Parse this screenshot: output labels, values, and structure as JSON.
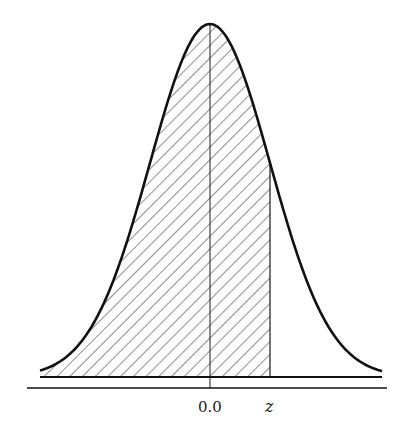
{
  "chart_data": {
    "type": "area",
    "title": "",
    "distribution": "standard normal",
    "mean": 0.0,
    "sd": 1.0,
    "x_range": [
      -2.85,
      2.87
    ],
    "shaded_region": {
      "from": "-inf",
      "to": "z",
      "pattern": "diagonal-hatch"
    },
    "z_value_approx": 1.0,
    "tick_labels": [
      "0.0",
      "z"
    ],
    "xlabel": "",
    "ylabel": "",
    "grid": false,
    "legend": null
  },
  "labels": {
    "mean": "0.0",
    "z": "z"
  },
  "colors": {
    "curve": "#1a1a1a",
    "hatch": "#333333",
    "background": "#ffffff"
  }
}
